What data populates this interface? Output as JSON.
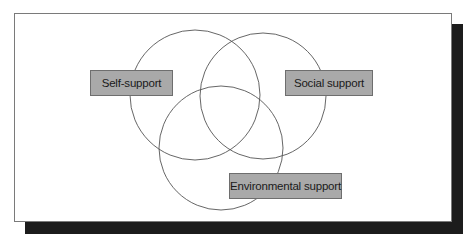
{
  "diagram": {
    "type": "venn",
    "sets": [
      {
        "id": "self",
        "label": "Self-support"
      },
      {
        "id": "social",
        "label": "Social support"
      },
      {
        "id": "environmental",
        "label": "Environmental support"
      }
    ],
    "colors": {
      "label_fill": "#a9a9a9",
      "circle_stroke": "#555555",
      "shadow": "#1c1c1c",
      "frame_border": "#7a7a7a"
    }
  }
}
